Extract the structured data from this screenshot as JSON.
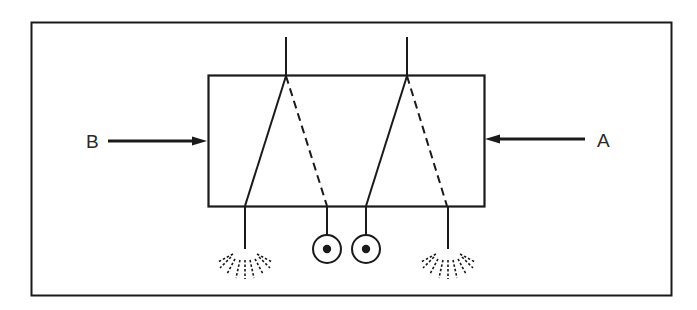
{
  "diagram": {
    "type": "schematic",
    "labels": {
      "input_left": "B",
      "input_right": "A"
    },
    "colors": {
      "stroke": "#1a1a1a",
      "background": "#ffffff"
    },
    "elements": {
      "frame": "outer-border",
      "box": "valve-body",
      "inlets_top": 2,
      "spray_outlets": 2,
      "indicator_outlets": 2
    }
  }
}
